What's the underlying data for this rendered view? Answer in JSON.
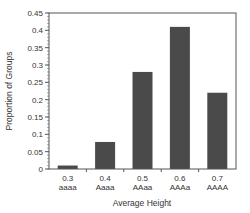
{
  "chart_data": {
    "type": "bar",
    "title": "",
    "xlabel": "Average Height",
    "ylabel": "Proportion of Groups",
    "categories": [
      "0.3\naaaa",
      "0.4\nAaaa",
      "0.5\nAAaa",
      "0.6\nAAAa",
      "0.7\nAAAA"
    ],
    "category_lines": [
      [
        "0.3",
        "aaaa"
      ],
      [
        "0.4",
        "Aaaa"
      ],
      [
        "0.5",
        "AAaa"
      ],
      [
        "0.6",
        "AAAa"
      ],
      [
        "0.7",
        "AAAA"
      ]
    ],
    "values": [
      0.01,
      0.078,
      0.28,
      0.41,
      0.22
    ],
    "ylim": [
      0,
      0.45
    ],
    "yticks": [
      "0",
      "0.05",
      "0.1",
      "0.15",
      "0.2",
      "0.25",
      "0.3",
      "0.35",
      "0.4",
      "0.45"
    ],
    "grid": false,
    "legend": null,
    "bar_color": "#4a4a4a",
    "frame_color": "#555555"
  }
}
